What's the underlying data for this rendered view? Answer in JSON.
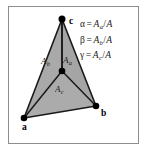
{
  "figure": {
    "colors": {
      "triangle_fill": "#a9a9a9",
      "triangle_fill_dark": "#9d9d9d",
      "edge": "#1a1a1a",
      "frame": "#8d8d8d",
      "background": "#ffffff",
      "text": "#1a1a1a"
    },
    "vertices": [
      {
        "id": "a",
        "label": "a",
        "x": 24,
        "y": 118
      },
      {
        "id": "b",
        "label": "b",
        "x": 96,
        "y": 106
      },
      {
        "id": "c",
        "label": "c",
        "x": 62,
        "y": 19
      }
    ],
    "interior_point": {
      "id": "p",
      "x": 62,
      "y": 71
    },
    "sub_areas": [
      {
        "id": "Aa",
        "base": "A",
        "sub": "a",
        "x": 63,
        "y": 55
      },
      {
        "id": "Ab",
        "base": "A",
        "sub": "b",
        "x": 41,
        "y": 56
      },
      {
        "id": "Ac",
        "base": "A",
        "sub": "c",
        "x": 55,
        "y": 84
      }
    ],
    "equations": [
      {
        "id": "alpha",
        "greek": "α",
        "equals": "=",
        "numerator_base": "A",
        "numerator_sub": "a",
        "slash": "/",
        "denominator": "A"
      },
      {
        "id": "beta",
        "greek": "β",
        "equals": "=",
        "numerator_base": "A",
        "numerator_sub": "b",
        "slash": "/",
        "denominator": "A"
      },
      {
        "id": "gamma",
        "greek": "γ",
        "equals": "=",
        "numerator_base": "A",
        "numerator_sub": "c",
        "slash": "/",
        "denominator": "A"
      }
    ]
  }
}
